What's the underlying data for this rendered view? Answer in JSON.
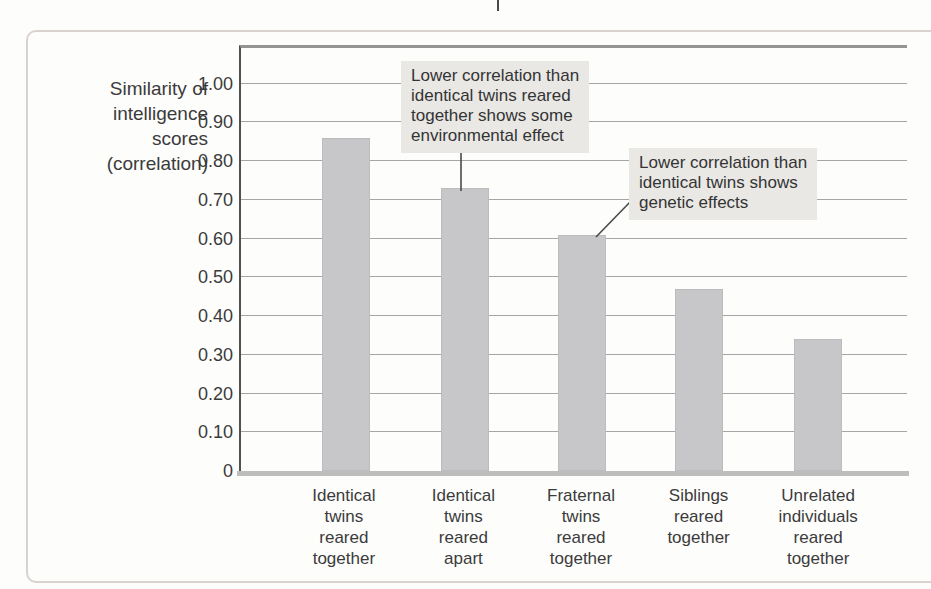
{
  "page": {
    "background_color": "#fdfdfc",
    "frame_border_color": "#d9d3d0"
  },
  "chart_data": {
    "type": "bar",
    "title": "",
    "ylabel": "Similarity of intelligence scores (correlation)",
    "ylabel_lines": [
      "Similarity of",
      "intelligence",
      "scores",
      "(correlation)"
    ],
    "categories": [
      "Identical twins reared together",
      "Identical twins reared apart",
      "Fraternal twins reared together",
      "Siblings reared together",
      "Unrelated individuals reared together"
    ],
    "category_label_lines": [
      [
        "Identical",
        "twins",
        "reared",
        "together"
      ],
      [
        "Identical",
        "twins",
        "reared",
        "apart"
      ],
      [
        "Fraternal",
        "twins",
        "reared",
        "together"
      ],
      [
        "Siblings",
        "reared",
        "together"
      ],
      [
        "Unrelated",
        "individuals",
        "reared",
        "together"
      ]
    ],
    "values": [
      0.86,
      0.73,
      0.61,
      0.47,
      0.34
    ],
    "yticks": [
      {
        "value": 1.0,
        "label": "1.00"
      },
      {
        "value": 0.9,
        "label": "0.90"
      },
      {
        "value": 0.8,
        "label": "0.80"
      },
      {
        "value": 0.7,
        "label": "0.70"
      },
      {
        "value": 0.6,
        "label": "0.60"
      },
      {
        "value": 0.5,
        "label": "0.50"
      },
      {
        "value": 0.4,
        "label": "0.40"
      },
      {
        "value": 0.3,
        "label": "0.30"
      },
      {
        "value": 0.2,
        "label": "0.20"
      },
      {
        "value": 0.1,
        "label": "0.10"
      },
      {
        "value": 0,
        "label": "0"
      }
    ],
    "ylim": [
      0,
      1.1
    ],
    "grid": "horizontal",
    "legend": "none",
    "bar_color": "#c7c7c9",
    "annotations": [
      {
        "lines": [
          "Lower correlation than",
          "identical twins reared",
          "together shows some",
          "environmental effect"
        ],
        "text": "Lower correlation than identical twins reared together shows some environmental effect",
        "target_category": "Identical twins reared apart"
      },
      {
        "lines": [
          "Lower correlation than",
          "identical twins shows",
          "genetic effects"
        ],
        "text": "Lower correlation than identical twins shows genetic effects",
        "target_category": "Fraternal twins reared together"
      }
    ]
  }
}
